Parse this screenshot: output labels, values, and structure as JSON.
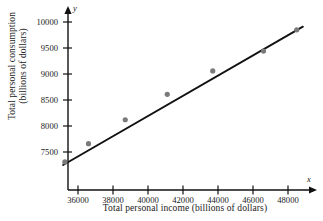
{
  "chart_data": {
    "type": "scatter",
    "title": "",
    "xlabel": "Total personal income (billions of dollars)",
    "ylabel_line1": "Total personal consumption",
    "ylabel_line2": "(billions of dollars)",
    "x_axis_symbol": "x",
    "y_axis_symbol": "y",
    "xlim": [
      34900,
      49400
    ],
    "ylim": [
      7180,
      10080
    ],
    "xticks": [
      36000,
      38000,
      40000,
      42000,
      44000,
      46000,
      48000
    ],
    "yticks": [
      7500,
      8000,
      8500,
      9000,
      9500,
      10000
    ],
    "xtick_labels": [
      "36000",
      "38000",
      "40000",
      "42000",
      "44000",
      "46000",
      "48000"
    ],
    "ytick_labels": [
      "7500",
      "8000",
      "8500",
      "9000",
      "9500",
      "10000"
    ],
    "grid": false,
    "legend": false,
    "series": [
      {
        "name": "observations",
        "marker": "filled-circle",
        "color": "#7a7a7a",
        "points": [
          {
            "x": 35250,
            "y": 7310
          },
          {
            "x": 36600,
            "y": 7660
          },
          {
            "x": 38700,
            "y": 8120
          },
          {
            "x": 41100,
            "y": 8610
          },
          {
            "x": 43700,
            "y": 9060
          },
          {
            "x": 46600,
            "y": 9440
          },
          {
            "x": 48500,
            "y": 9850
          }
        ]
      }
    ],
    "trend_line": {
      "name": "least-squares regression line",
      "color": "#111111",
      "x_start": 35150,
      "y_start": 7250,
      "x_end": 48850,
      "y_end": 9910
    },
    "axis_color": "#111111",
    "marker_color": "#7a7a7a"
  }
}
